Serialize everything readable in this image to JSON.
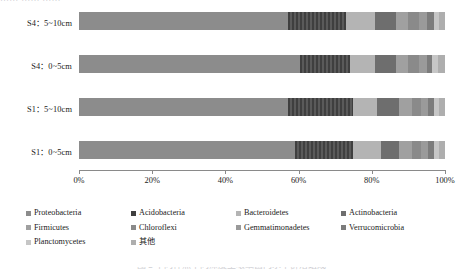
{
  "figure": {
    "top_cut_text": "…… …… ……",
    "caption_cut_text": "图 2    不同样点不同深度土壤细菌门水平群落组成"
  },
  "axis": {
    "ticks": [
      "0%",
      "20%",
      "40%",
      "60%",
      "80%",
      "100%"
    ],
    "tick_values": [
      0,
      20,
      40,
      60,
      80,
      100
    ]
  },
  "legend": {
    "items": [
      {
        "label": "Proteobacteria",
        "color": "#8c8c8c"
      },
      {
        "label": "Acidobacteria",
        "color": "#3f3f3f"
      },
      {
        "label": "Bacteroidetes",
        "color": "#b4b4b4"
      },
      {
        "label": "Actinobacteria",
        "color": "#6e6e6e"
      },
      {
        "label": "Firmicutes",
        "color": "#a0a0a0"
      },
      {
        "label": "Chloroflexi",
        "color": "#8a8a8a"
      },
      {
        "label": "Gemmatimonadetes",
        "color": "#9a9a9a"
      },
      {
        "label": "Verrucomicrobia",
        "color": "#7c7c7c"
      },
      {
        "label": "Planctomycetes",
        "color": "#c6c6c6"
      },
      {
        "label": "其他",
        "color": "#aeaeae"
      }
    ]
  },
  "chart_data": {
    "type": "bar",
    "orientation": "horizontal",
    "stacked": true,
    "normalized": "100%",
    "title": "",
    "xlabel": "",
    "ylabel": "",
    "xlim": [
      0,
      100
    ],
    "grid": false,
    "legend_position": "bottom",
    "categories": [
      "S1：0~5cm",
      "S1：5~10cm",
      "S4：0~5cm",
      "S4：5~10cm"
    ],
    "series": [
      {
        "name": "Proteobacteria",
        "color": "#8c8c8c",
        "values": [
          59.0,
          57.0,
          60.5,
          57.0
        ]
      },
      {
        "name": "Acidobacteria",
        "color": "#3f3f3f",
        "values": [
          16.0,
          18.0,
          13.5,
          16.0
        ]
      },
      {
        "name": "Bacteroidetes",
        "color": "#b4b4b4",
        "values": [
          7.5,
          6.5,
          7.0,
          8.0
        ]
      },
      {
        "name": "Actinobacteria",
        "color": "#6e6e6e",
        "values": [
          5.0,
          6.0,
          5.5,
          5.5
        ]
      },
      {
        "name": "Firmicutes",
        "color": "#a0a0a0",
        "values": [
          3.5,
          3.5,
          3.5,
          3.5
        ]
      },
      {
        "name": "Chloroflexi",
        "color": "#8a8a8a",
        "values": [
          2.5,
          2.5,
          3.0,
          3.0
        ]
      },
      {
        "name": "Gemmatimonadetes",
        "color": "#9a9a9a",
        "values": [
          2.0,
          2.0,
          2.0,
          2.0
        ]
      },
      {
        "name": "Verrucomicrobia",
        "color": "#7c7c7c",
        "values": [
          1.5,
          1.5,
          1.5,
          2.0
        ]
      },
      {
        "name": "Planctomycetes",
        "color": "#c6c6c6",
        "values": [
          1.5,
          1.5,
          1.5,
          1.5
        ]
      },
      {
        "name": "其他",
        "color": "#aeaeae",
        "values": [
          1.5,
          1.5,
          2.0,
          1.5
        ]
      }
    ]
  }
}
